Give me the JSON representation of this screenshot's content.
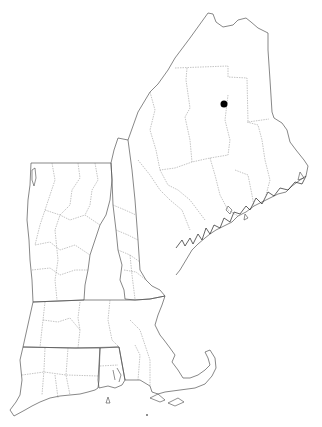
{
  "map": {
    "region": "New England",
    "states": [
      "Maine",
      "New Hampshire",
      "Vermont",
      "Massachusetts",
      "Connecticut",
      "Rhode Island"
    ],
    "boundaries": [
      "state",
      "county"
    ],
    "marker": {
      "x": 224,
      "y": 104,
      "radius": 3.5,
      "color": "#000000",
      "location_state": "Maine"
    },
    "background": "#ffffff"
  }
}
